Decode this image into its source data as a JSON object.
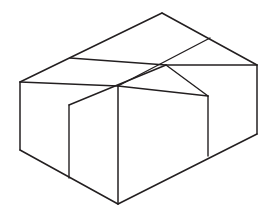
{
  "figure": {
    "shape_name": "cube-block",
    "cube_count": "6",
    "arrangement": "2 x 3 x 1",
    "dimensions": {
      "width_cubes": "3",
      "depth_cubes": "2",
      "height_cubes": "1"
    },
    "style": {
      "stroke_color": "#231f20",
      "fill_color": "#ffffff",
      "background_color": "#ffffff",
      "stroke_width": "1.5"
    },
    "canvas": {
      "width": "275",
      "height": "222"
    },
    "visible_faces": [
      "top",
      "front-left",
      "front-right"
    ],
    "geometry": {
      "outline": "20,82 162,13 257,65 257,134 118,204 20,150",
      "vertices": {
        "left": "20,82",
        "bottom_left": "20,150",
        "top_apex": "162,13",
        "right": "257,65",
        "bottom_right": "257,134",
        "front_bottom": "118,204",
        "front_top": "118,86",
        "top_mid_left": "70,58",
        "top_mid_right": "210,38",
        "top_center": "166,65",
        "top_left_front": "69,105",
        "top_right_front": "208,96"
      },
      "top_face_lines": [
        "70,58 166,65",
        "166,65 118,86",
        "210,38 166,65",
        "69,105 166,65",
        "20,82 118,86",
        "118,86 208,96"
      ],
      "front_left_face_divider": "69,105 69,178",
      "front_right_face_divider": "208,96 208,156",
      "front_vertical_edge": "118,86 118,204"
    }
  }
}
